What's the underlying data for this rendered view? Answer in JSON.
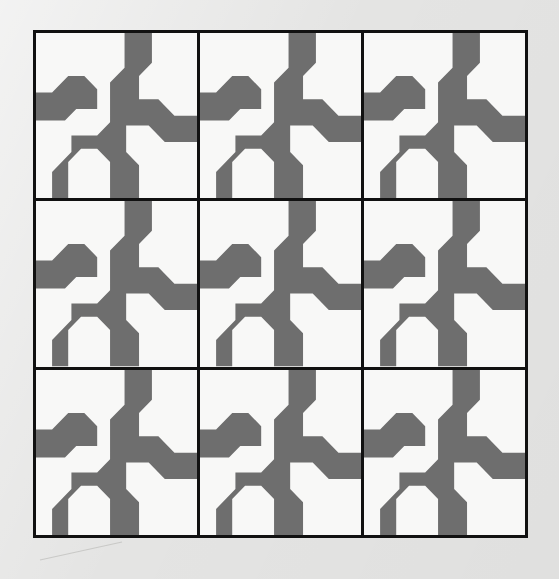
{
  "artwork": {
    "title": "Tiled Geometric Pattern",
    "description": "A 3 by 3 grid of identical tiles forming a repeating interlocking chevron and cross motif",
    "tile_count": 9,
    "grid_rows": 3,
    "grid_columns": 3
  },
  "colors": {
    "background": "#e4e4e3",
    "tile_fill": "#f8f8f7",
    "motif_gray": "#6e6e6e",
    "grid_line": "#111111"
  },
  "layout": {
    "frame_left": 33,
    "frame_top": 30,
    "frame_width": 495,
    "frame_height": 508,
    "grid_line_width": 3
  },
  "motif": {
    "name": "interlocking-chevron-cross",
    "viewbox": "0 0 100 100",
    "paths": [
      "M 0,36 L 10,36 L 20,26 L 30,26 L 38,34 L 38,46 L 25,46 L 18,53 L 0,53 Z",
      "M 55,0 L 72,0 L 72,18 L 64,26 L 64,40 L 76,40 L 86,50 L 100,50 L 100,66 L 80,66 L 70,56 L 56,56 L 56,72 L 64,80 L 64,100 L 46,100 L 46,78 L 38,70 L 28,70 L 20,78 L 20,100 L 10,100 L 10,84 L 22,72 L 22,62 L 38,62 L 46,54 L 46,30 L 55,21 Z"
    ]
  },
  "annotations": {
    "pencil_guide_visible": true
  }
}
